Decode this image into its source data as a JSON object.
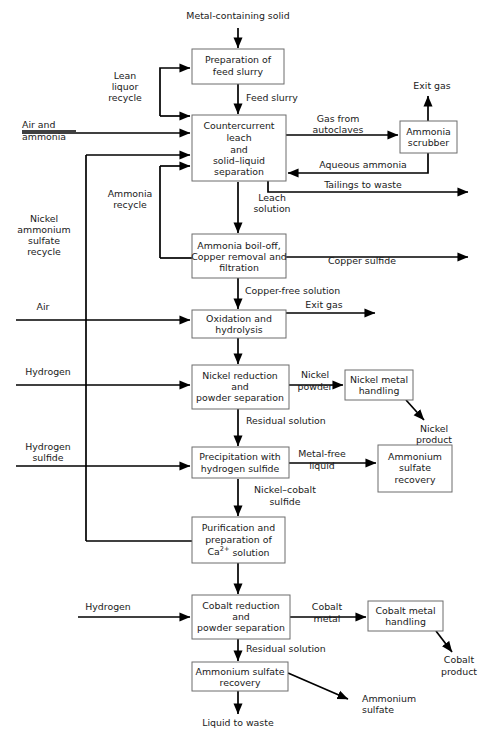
{
  "diagram": {
    "line_color": "#000000",
    "box_stroke": "#6d6d6d",
    "box_fill": "#ffffff",
    "process_boxes": [
      {
        "id": "prep_feed",
        "lines": [
          "Preparation of",
          "feed slurry"
        ]
      },
      {
        "id": "counter_leach",
        "lines": [
          "Countercurrent",
          "leach",
          "and",
          "solid–liquid",
          "separation"
        ]
      },
      {
        "id": "ammonia_scrubber",
        "lines": [
          "Ammonia",
          "scrubber"
        ]
      },
      {
        "id": "boil_off",
        "lines": [
          "Ammonia boil-off,",
          "Copper removal and",
          "filtration"
        ]
      },
      {
        "id": "oxidation",
        "lines": [
          "Oxidation and",
          "hydrolysis"
        ]
      },
      {
        "id": "nickel_reduction",
        "lines": [
          "Nickel reduction",
          "and",
          "powder separation"
        ]
      },
      {
        "id": "nickel_handling",
        "lines": [
          "Nickel metal",
          "handling"
        ]
      },
      {
        "id": "precipitation",
        "lines": [
          "Precipitation with",
          "hydrogen sulfide"
        ]
      },
      {
        "id": "am_sulf_recovery_right",
        "lines": [
          "Ammonium",
          "sulfate",
          "recovery"
        ]
      },
      {
        "id": "purification",
        "lines": [
          "Purification and",
          "preparation of",
          "Ca2+ solution"
        ]
      },
      {
        "id": "cobalt_reduction",
        "lines": [
          "Cobalt reduction",
          "and",
          "powder separation"
        ]
      },
      {
        "id": "cobalt_handling",
        "lines": [
          "Cobalt metal",
          "handling"
        ]
      },
      {
        "id": "am_sulf_recovery_bottom",
        "lines": [
          "Ammonium sulfate",
          "recovery"
        ]
      }
    ],
    "stream_labels": [
      {
        "id": "metal_solid",
        "text": "Metal-containing solid"
      },
      {
        "id": "lean_liquor_1",
        "text": "Lean"
      },
      {
        "id": "lean_liquor_2",
        "text": "liquor"
      },
      {
        "id": "lean_liquor_3",
        "text": "recycle"
      },
      {
        "id": "feed_slurry",
        "text": "Feed slurry"
      },
      {
        "id": "air_ammonia_1",
        "text": "Air and"
      },
      {
        "id": "air_ammonia_2",
        "text": "ammonia"
      },
      {
        "id": "gas_autoclaves_1",
        "text": "Gas from"
      },
      {
        "id": "gas_autoclaves_2",
        "text": "autoclaves"
      },
      {
        "id": "exit_gas_top",
        "text": "Exit gas"
      },
      {
        "id": "aqueous_ammonia",
        "text": "Aqueous ammonia"
      },
      {
        "id": "tailings",
        "text": "Tailings to waste"
      },
      {
        "id": "ammonia_recycle_1",
        "text": "Ammonia"
      },
      {
        "id": "ammonia_recycle_2",
        "text": "recycle"
      },
      {
        "id": "leach_solution_1",
        "text": "Leach"
      },
      {
        "id": "leach_solution_2",
        "text": "solution"
      },
      {
        "id": "ni_am_sulf_1",
        "text": "Nickel"
      },
      {
        "id": "ni_am_sulf_2",
        "text": "ammonium"
      },
      {
        "id": "ni_am_sulf_3",
        "text": "sulfate"
      },
      {
        "id": "ni_am_sulf_4",
        "text": "recycle"
      },
      {
        "id": "copper_sulfide",
        "text": "Copper sulfide"
      },
      {
        "id": "copper_free",
        "text": "Copper-free solution"
      },
      {
        "id": "air",
        "text": "Air"
      },
      {
        "id": "exit_gas_oxidation",
        "text": "Exit gas"
      },
      {
        "id": "hydrogen_nickel",
        "text": "Hydrogen"
      },
      {
        "id": "nickel_powder_1",
        "text": "Nickel"
      },
      {
        "id": "nickel_powder_2",
        "text": "powder"
      },
      {
        "id": "nickel_product_1",
        "text": "Nickel"
      },
      {
        "id": "nickel_product_2",
        "text": "product"
      },
      {
        "id": "residual_sol_ni",
        "text": "Residual solution"
      },
      {
        "id": "hydrogen_sulfide_1",
        "text": "Hydrogen"
      },
      {
        "id": "hydrogen_sulfide_2",
        "text": "sulfide"
      },
      {
        "id": "metal_free_1",
        "text": "Metal-free"
      },
      {
        "id": "metal_free_2",
        "text": "liquid"
      },
      {
        "id": "ni_co_sulfide_1",
        "text": "Nickel–cobalt"
      },
      {
        "id": "ni_co_sulfide_2",
        "text": "sulfide"
      },
      {
        "id": "hydrogen_cobalt",
        "text": "Hydrogen"
      },
      {
        "id": "cobalt_metal_1",
        "text": "Cobalt"
      },
      {
        "id": "cobalt_metal_2",
        "text": "metal"
      },
      {
        "id": "cobalt_product_1",
        "text": "Cobalt"
      },
      {
        "id": "cobalt_product_2",
        "text": "product"
      },
      {
        "id": "residual_sol_co",
        "text": "Residual solution"
      },
      {
        "id": "ammonium_sulfate_1",
        "text": "Ammonium"
      },
      {
        "id": "ammonium_sulfate_2",
        "text": "sulfate"
      },
      {
        "id": "liquid_waste",
        "text": "Liquid to waste"
      }
    ]
  }
}
